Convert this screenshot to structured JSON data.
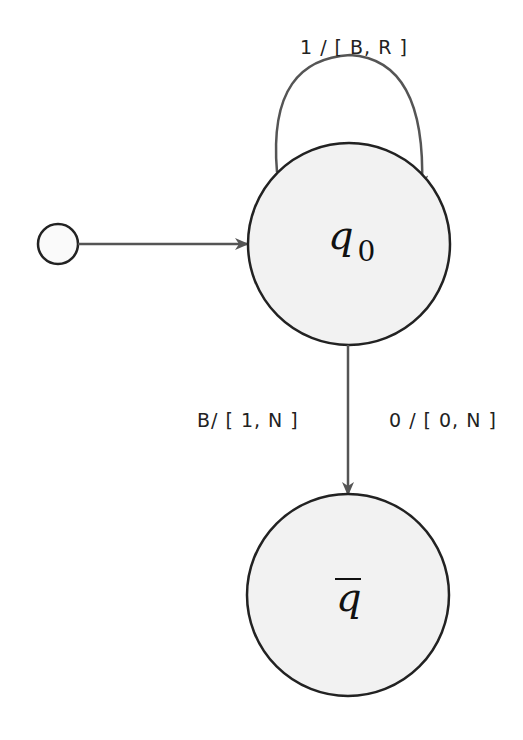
{
  "diagram": {
    "type": "turing-machine-state-diagram",
    "states": [
      {
        "id": "start",
        "label": "",
        "role": "initial-marker"
      },
      {
        "id": "q0",
        "label": "q",
        "subscript": "0"
      },
      {
        "id": "qbar",
        "label": "q",
        "overline": true
      }
    ],
    "transitions": [
      {
        "from": "start",
        "to": "q0",
        "label": ""
      },
      {
        "from": "q0",
        "to": "q0",
        "label": "1 / [ B, R ]"
      },
      {
        "from": "q0",
        "to": "qbar",
        "label_left": "B/ [ 1, N ]",
        "label_right": "0 / [ 0, N ]"
      }
    ],
    "colors": {
      "state_fill": "#f2f2f2",
      "stroke": "#222222",
      "edge": "#555555"
    }
  }
}
